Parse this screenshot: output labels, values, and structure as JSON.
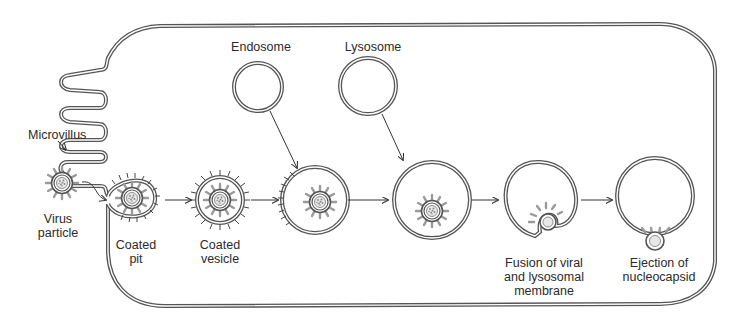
{
  "diagram": {
    "colors": {
      "membrane": "#555555",
      "spike": "#9a9a9a",
      "text": "#2a2a2a",
      "background": "#ffffff"
    },
    "labels": {
      "microvillus": "Microvillus",
      "virus_particle": "Virus\nparticle",
      "coated_pit": "Coated\npit",
      "coated_vesicle": "Coated\nvesicle",
      "endosome": "Endosome",
      "lysosome": "Lysosome",
      "fusion": "Fusion of viral\nand lysosomal\nmembrane",
      "ejection": "Ejection of\nnucleocapsid"
    },
    "steps": [
      {
        "id": "virus-particle",
        "label": "Virus particle"
      },
      {
        "id": "coated-pit",
        "label": "Coated pit"
      },
      {
        "id": "coated-vesicle",
        "label": "Coated vesicle"
      },
      {
        "id": "endosome-fusion",
        "label": ""
      },
      {
        "id": "lysosome-fusion",
        "label": ""
      },
      {
        "id": "membrane-fusion",
        "label": "Fusion of viral and lysosomal membrane"
      },
      {
        "id": "nucleocapsid-ejection",
        "label": "Ejection of nucleocapsid"
      }
    ]
  }
}
